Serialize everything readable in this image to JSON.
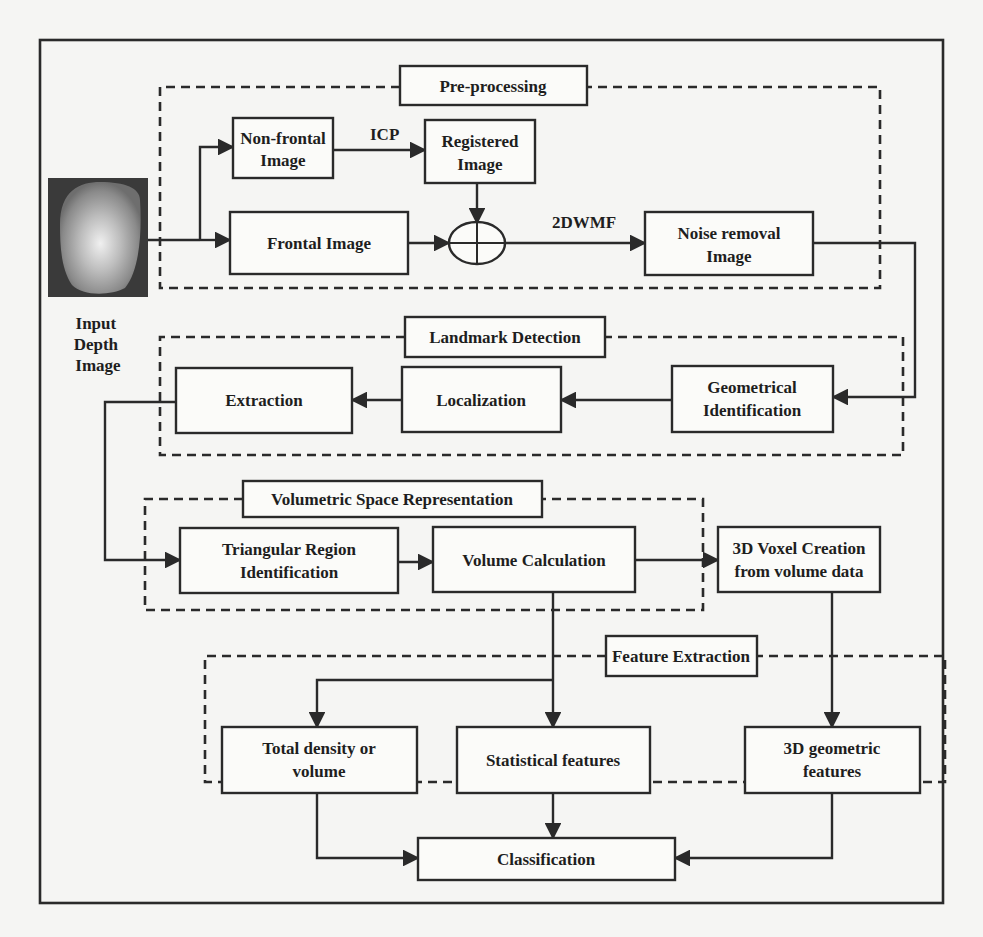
{
  "diagram": {
    "input": {
      "label_lines": [
        "Input",
        "Depth",
        "Image"
      ],
      "image_icon": "depth-face-image"
    },
    "groups": {
      "preprocessing": {
        "label": "Pre-processing"
      },
      "landmark_detection": {
        "label": "Landmark Detection"
      },
      "volumetric_space": {
        "label": "Volumetric Space Representation"
      },
      "feature_extraction": {
        "label": "Feature Extraction"
      }
    },
    "nodes": {
      "non_frontal": {
        "lines": [
          "Non-frontal",
          "Image"
        ]
      },
      "registered": {
        "lines": [
          "Registered",
          "Image"
        ]
      },
      "frontal": {
        "lines": [
          "Frontal Image"
        ]
      },
      "noise_removal": {
        "lines": [
          "Noise removal",
          "Image"
        ]
      },
      "geometrical": {
        "lines": [
          "Geometrical",
          "Identification"
        ]
      },
      "localization": {
        "lines": [
          "Localization"
        ]
      },
      "extraction": {
        "lines": [
          "Extraction"
        ]
      },
      "triangular": {
        "lines": [
          "Triangular Region",
          "Identification"
        ]
      },
      "volume_calc": {
        "lines": [
          "Volume Calculation"
        ]
      },
      "voxel": {
        "lines": [
          "3D Voxel Creation",
          "from volume data"
        ]
      },
      "total_density": {
        "lines": [
          "Total density or",
          "volume"
        ]
      },
      "statistical": {
        "lines": [
          "Statistical features"
        ]
      },
      "geometric3d": {
        "lines": [
          "3D geometric",
          "features"
        ]
      },
      "classification": {
        "lines": [
          "Classification"
        ]
      }
    },
    "edge_labels": {
      "icp": "ICP",
      "wmf": "2DWMF"
    },
    "junction_icon": "summing-junction"
  },
  "colors": {
    "ink": "#2a2a2a",
    "paper": "#f5f5f3",
    "box_fill": "#fbfbf9"
  }
}
